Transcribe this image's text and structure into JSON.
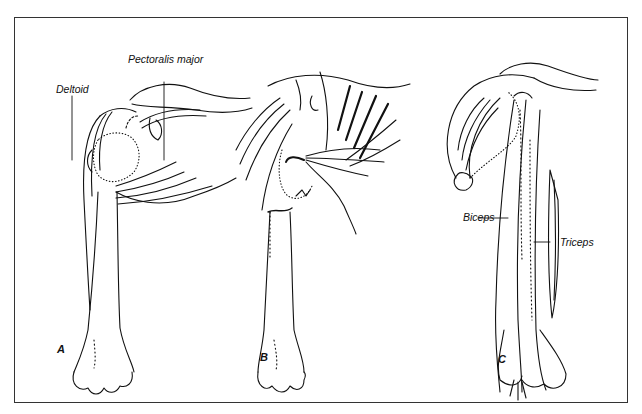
{
  "figure": {
    "panels": [
      {
        "id": "A",
        "letter": "A",
        "labels": [
          "Deltoid",
          "Pectoralis major"
        ]
      },
      {
        "id": "B",
        "letter": "B",
        "labels": []
      },
      {
        "id": "C",
        "letter": "C",
        "labels": [
          "Biceps",
          "Triceps"
        ]
      }
    ],
    "labels": {
      "deltoid": "Deltoid",
      "pectoralis_major": "Pectoralis major",
      "biceps": "Biceps",
      "triceps": "Triceps"
    },
    "letters": {
      "a": "A",
      "b": "B",
      "c": "C"
    }
  },
  "colors": {
    "ink": "#111111",
    "frame": "#333333",
    "background": "#ffffff"
  }
}
